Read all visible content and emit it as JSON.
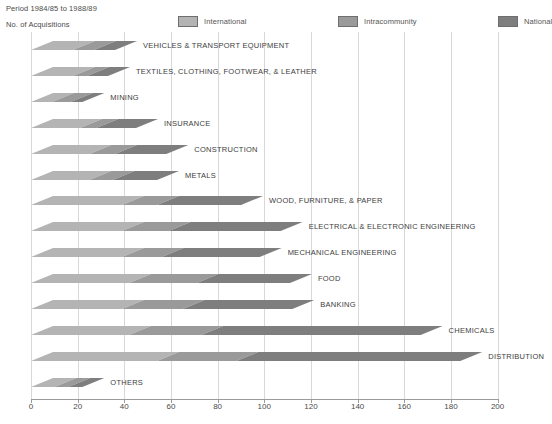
{
  "header": {
    "period": "Period 1984/85 to 1988/89",
    "yaxis_caption": "No. of Acquisitions"
  },
  "legend": {
    "items": [
      {
        "label": "International",
        "color": "#b4b4b4"
      },
      {
        "label": "Intracommunity",
        "color": "#9a9a9a"
      },
      {
        "label": "National",
        "color": "#7e7e7e"
      }
    ]
  },
  "chart_data": {
    "type": "bar",
    "orientation": "horizontal",
    "stacked": true,
    "title": "Period 1984/85 to 1988/89",
    "xlabel": "",
    "ylabel": "No. of Acquisitions",
    "xlim": [
      0,
      200
    ],
    "xticks": [
      0,
      20,
      40,
      60,
      80,
      100,
      120,
      140,
      160,
      180,
      200
    ],
    "grid": true,
    "legend_position": "top",
    "categories": [
      "VEHICLES & TRANSPORT EQUIPMENT",
      "TEXTILES, CLOTHING, FOOTWEAR, & LEATHER",
      "MINING",
      "INSURANCE",
      "CONSTRUCTION",
      "METALS",
      "WOOD, FURNITURE, & PAPER",
      "ELECTRICAL & ELECTRONIC ENGINEERING",
      "MECHANICAL ENGINEERING",
      "FOOD",
      "BANKING",
      "CHEMICALS",
      "DISTRIBUTION",
      "OTHERS"
    ],
    "series": [
      {
        "name": "International",
        "color": "#b4b4b4",
        "values": [
          18,
          18,
          9,
          21,
          25,
          25,
          39,
          39,
          39,
          42,
          39,
          42,
          54,
          10
        ]
      },
      {
        "name": "Intracommunity",
        "color": "#9a9a9a",
        "values": [
          9,
          6,
          8,
          7,
          11,
          10,
          15,
          20,
          17,
          29,
          26,
          31,
          34,
          6
        ]
      },
      {
        "name": "National",
        "color": "#7e7e7e",
        "values": [
          9,
          9,
          5,
          17,
          22,
          19,
          36,
          48,
          42,
          40,
          47,
          94,
          96,
          6
        ]
      }
    ],
    "totals": [
      36,
      33,
      22,
      45,
      58,
      54,
      90,
      107,
      98,
      111,
      112,
      167,
      184,
      22
    ]
  }
}
